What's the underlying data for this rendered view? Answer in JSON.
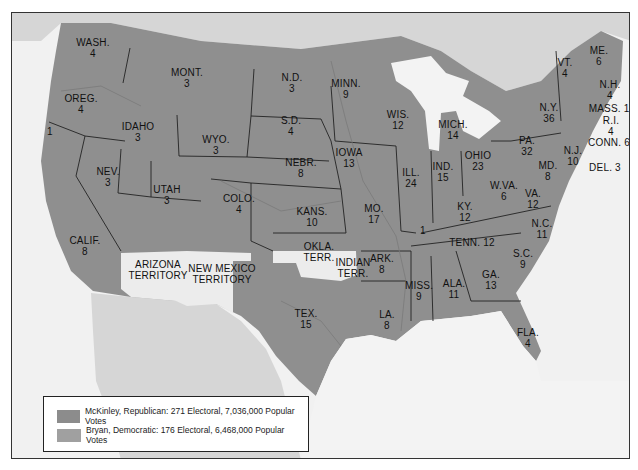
{
  "colors": {
    "mckinley": "#8c8c8c",
    "bryan": "#9b9b9b",
    "territory": "#ececec",
    "foreign_land": "#d6d6d6",
    "water": "#f3f3f3",
    "border": "#222222"
  },
  "states": [
    {
      "abbr": "WASH.",
      "ev": "4",
      "x": 92,
      "y": 42
    },
    {
      "abbr": "MONT.",
      "ev": "3",
      "x": 186,
      "y": 72
    },
    {
      "abbr": "OREG.",
      "ev": "4",
      "x": 80,
      "y": 98
    },
    {
      "abbr": "IDAHO",
      "ev": "3",
      "x": 137,
      "y": 126
    },
    {
      "abbr": "WYO.",
      "ev": "3",
      "x": 215,
      "y": 139
    },
    {
      "abbr": "N.D.",
      "ev": "3",
      "x": 291,
      "y": 77
    },
    {
      "abbr": "S.D.",
      "ev": "4",
      "x": 290,
      "y": 120
    },
    {
      "abbr": "MINN.",
      "ev": "9",
      "x": 345,
      "y": 83
    },
    {
      "abbr": "WIS.",
      "ev": "12",
      "x": 397,
      "y": 114
    },
    {
      "abbr": "MICH.",
      "ev": "14",
      "x": 452,
      "y": 124
    },
    {
      "abbr": "N.Y.",
      "ev": "36",
      "x": 548,
      "y": 107
    },
    {
      "abbr": "VT.",
      "ev": "4",
      "x": 564,
      "y": 62
    },
    {
      "abbr": "ME.",
      "ev": "6",
      "x": 598,
      "y": 50
    },
    {
      "abbr": "N.H.",
      "ev": "4",
      "x": 609,
      "y": 84
    },
    {
      "abbr": "MASS. 15",
      "ev": "",
      "x": 611,
      "y": 108
    },
    {
      "abbr": "R.I.",
      "ev": "4",
      "x": 610,
      "y": 120
    },
    {
      "abbr": "CONN. 6",
      "ev": "",
      "x": 608,
      "y": 142
    },
    {
      "abbr": "N.J.",
      "ev": "10",
      "x": 572,
      "y": 150
    },
    {
      "abbr": "DEL. 3",
      "ev": "",
      "x": 604,
      "y": 167
    },
    {
      "abbr": "MD.",
      "ev": "8",
      "x": 547,
      "y": 165
    },
    {
      "abbr": "PA.",
      "ev": "32",
      "x": 526,
      "y": 140
    },
    {
      "abbr": "OHIO",
      "ev": "23",
      "x": 477,
      "y": 155
    },
    {
      "abbr": "IND.",
      "ev": "15",
      "x": 442,
      "y": 166
    },
    {
      "abbr": "ILL.",
      "ev": "24",
      "x": 410,
      "y": 172
    },
    {
      "abbr": "IOWA",
      "ev": "13",
      "x": 348,
      "y": 152
    },
    {
      "abbr": "NEBR.",
      "ev": "8",
      "x": 300,
      "y": 162
    },
    {
      "abbr": "NEV.",
      "ev": "3",
      "x": 107,
      "y": 171
    },
    {
      "abbr": "UTAH",
      "ev": "3",
      "x": 166,
      "y": 189
    },
    {
      "abbr": "COLO.",
      "ev": "4",
      "x": 238,
      "y": 198
    },
    {
      "abbr": "KANS.",
      "ev": "10",
      "x": 311,
      "y": 211
    },
    {
      "abbr": "MO.",
      "ev": "17",
      "x": 373,
      "y": 208
    },
    {
      "abbr": "KY.",
      "ev": "12",
      "x": 464,
      "y": 206
    },
    {
      "abbr": "W.VA.",
      "ev": "6",
      "x": 503,
      "y": 185
    },
    {
      "abbr": "VA.",
      "ev": "12",
      "x": 532,
      "y": 193
    },
    {
      "abbr": "N.C.",
      "ev": "11",
      "x": 541,
      "y": 223
    },
    {
      "abbr": "TENN. 12",
      "ev": "",
      "x": 471,
      "y": 242
    },
    {
      "abbr": "S.C.",
      "ev": "9",
      "x": 522,
      "y": 253
    },
    {
      "abbr": "GA.",
      "ev": "13",
      "x": 490,
      "y": 274
    },
    {
      "abbr": "ALA.",
      "ev": "11",
      "x": 453,
      "y": 283
    },
    {
      "abbr": "MISS.",
      "ev": "9",
      "x": 418,
      "y": 285
    },
    {
      "abbr": "ARK.",
      "ev": "8",
      "x": 381,
      "y": 258
    },
    {
      "abbr": "LA.",
      "ev": "8",
      "x": 386,
      "y": 314
    },
    {
      "abbr": "TEX.",
      "ev": "15",
      "x": 305,
      "y": 313
    },
    {
      "abbr": "CALIF.",
      "ev": "8",
      "x": 84,
      "y": 240
    },
    {
      "abbr": "FLA.",
      "ev": "4",
      "x": 527,
      "y": 332
    },
    {
      "abbr": "1",
      "ev": "",
      "x": 49,
      "y": 131
    },
    {
      "abbr": "1",
      "ev": "",
      "x": 422,
      "y": 230
    }
  ],
  "territories": [
    {
      "name": "ARIZONA\nTERRITORY",
      "x": 157,
      "y": 264
    },
    {
      "name": "NEW MEXICO\nTERRITORY",
      "x": 221,
      "y": 268
    },
    {
      "name": "OKLA.\nTERR.",
      "x": 318,
      "y": 246
    },
    {
      "name": "INDIAN\nTERR.",
      "x": 352,
      "y": 262
    }
  ],
  "legend": {
    "items": [
      {
        "label": "McKinley, Republican: 271 Electoral, 7,036,000 Popular Votes"
      },
      {
        "label": "Bryan, Democratic: 176 Electoral, 6,468,000 Popular Votes"
      }
    ]
  }
}
